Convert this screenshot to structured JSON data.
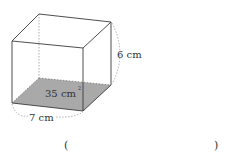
{
  "figure": {
    "type": "cuboid",
    "labels": {
      "height": "6 cm",
      "width": "7 cm",
      "base_area": "35 cm",
      "base_area_exponent": "2"
    },
    "colors": {
      "edge": "#3a3a3a",
      "hidden_edge": "#9a9a9a",
      "base_fill": "#a9a9a9",
      "dimension_arc": "#9a9a9a"
    }
  },
  "answer": {
    "open_paren": "(",
    "close_paren": ")",
    "value": ""
  }
}
